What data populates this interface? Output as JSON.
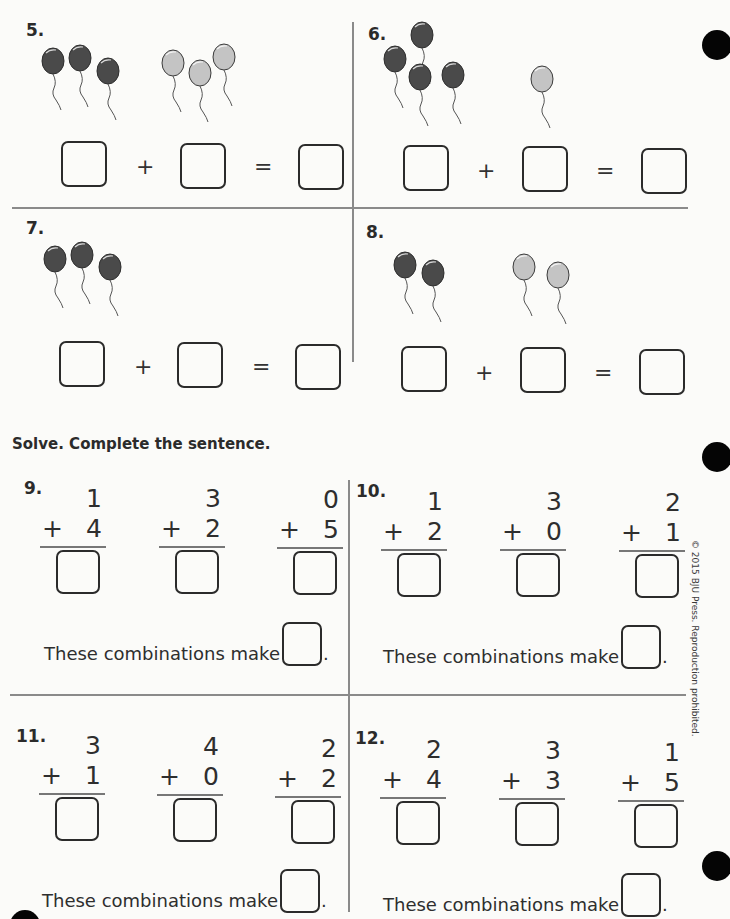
{
  "colors": {
    "dark_balloon": "#4a4a4a",
    "light_balloon": "#c4c4c4",
    "ink": "#2b2b2b",
    "divider": "#8a8a8a",
    "punch_hole": "#050505"
  },
  "picture_problems": [
    {
      "number": "5.",
      "dark_balloons": 3,
      "light_balloons": 3,
      "plus": "+",
      "equals": "="
    },
    {
      "number": "6.",
      "dark_balloons": 4,
      "light_balloons": 1,
      "plus": "+",
      "equals": "="
    },
    {
      "number": "7.",
      "dark_balloons": 3,
      "light_balloons": 0,
      "plus": "+",
      "equals": "="
    },
    {
      "number": "8.",
      "dark_balloons": 2,
      "light_balloons": 2,
      "plus": "+",
      "equals": "="
    }
  ],
  "instruction": "Solve. Complete the sentence.",
  "column_problems": [
    {
      "number": "9.",
      "items": [
        {
          "top": "1",
          "bottom": "4"
        },
        {
          "top": "3",
          "bottom": "2"
        },
        {
          "top": "0",
          "bottom": "5"
        }
      ],
      "sentence": "These combinations make",
      "period": "."
    },
    {
      "number": "10.",
      "items": [
        {
          "top": "1",
          "bottom": "2"
        },
        {
          "top": "3",
          "bottom": "0"
        },
        {
          "top": "2",
          "bottom": "1"
        }
      ],
      "sentence": "These combinations make",
      "period": "."
    },
    {
      "number": "11.",
      "items": [
        {
          "top": "3",
          "bottom": "1"
        },
        {
          "top": "4",
          "bottom": "0"
        },
        {
          "top": "2",
          "bottom": "2"
        }
      ],
      "sentence": "These combinations make",
      "period": "."
    },
    {
      "number": "12.",
      "items": [
        {
          "top": "2",
          "bottom": "4"
        },
        {
          "top": "3",
          "bottom": "3"
        },
        {
          "top": "1",
          "bottom": "5"
        }
      ],
      "sentence": "These combinations make",
      "period": "."
    }
  ],
  "plus_sign": "+",
  "copyright": "© 2015 BJU Press. Reproduction prohibited."
}
